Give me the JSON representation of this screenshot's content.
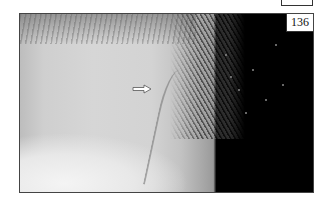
{
  "figure": {
    "number_label": "136",
    "annotation": {
      "type": "arrow",
      "direction": "right",
      "icon": "arrow-right-icon"
    },
    "colors": {
      "skin": "#d3d3d3",
      "background": "#000000",
      "frame_border": "#444444",
      "label_bg": "#ffffff"
    }
  }
}
